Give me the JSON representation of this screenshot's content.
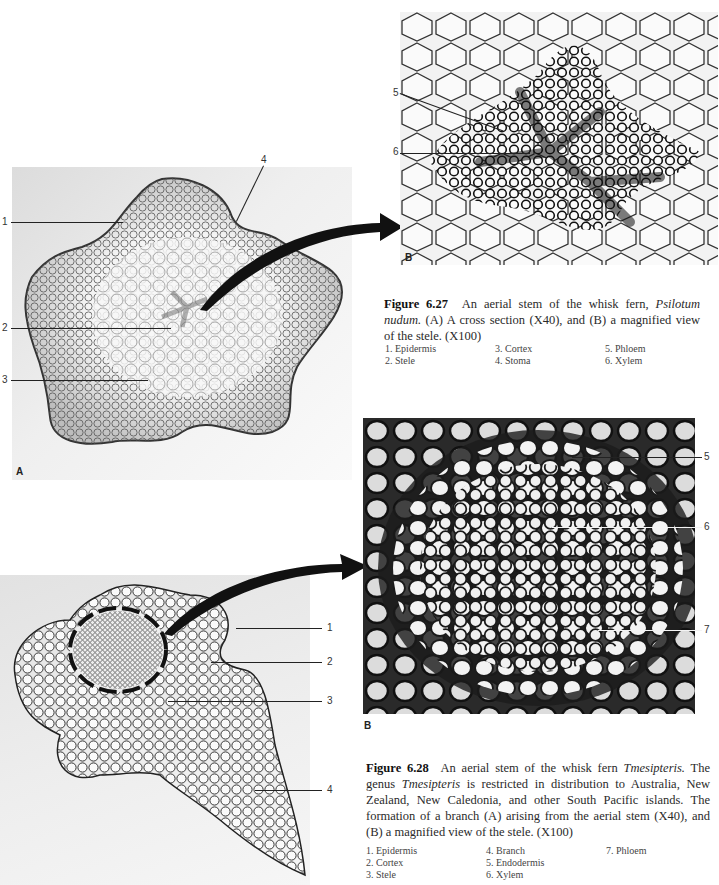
{
  "figure_6_27": {
    "panel_a": {
      "letter": "A",
      "labels": [
        "1",
        "2",
        "3",
        "4"
      ]
    },
    "panel_b": {
      "letter": "B",
      "labels": [
        "5",
        "6"
      ]
    },
    "caption": {
      "number": "Figure 6.27",
      "text_1": "An aerial stem of the whisk fern, ",
      "species": "Psilotum nudum.",
      "text_2": " (A) A cross section (X40), and (B) a magnified view of the stele. (X100)"
    },
    "legend": [
      "1. Epidermis",
      "2. Stele",
      "3. Cortex",
      "4. Stoma",
      "5. Phloem",
      "6. Xylem"
    ]
  },
  "figure_6_28": {
    "panel_a": {
      "labels": [
        "1",
        "2",
        "3",
        "4"
      ]
    },
    "panel_b": {
      "letter": "B",
      "labels": [
        "5",
        "6",
        "7"
      ]
    },
    "caption": {
      "number": "Figure 6.28",
      "text_1": "An aerial stem of the whisk fern ",
      "genus_1": "Tmesipteris.",
      "text_2": " The genus ",
      "genus_2": "Tmesipteris",
      "text_3": " is restricted in distribution to Australia, New Zealand, New Caledonia, and other South Pacific islands. The formation of a branch (A) arising from the aerial stem (X40), and (B) a magnified view of the stele. (X100)"
    },
    "legend": [
      "1. Epidermis",
      "2. Cortex",
      "3. Stele",
      "4. Branch",
      "5. Endodermis",
      "6. Xylem",
      "7. Phloem"
    ]
  }
}
